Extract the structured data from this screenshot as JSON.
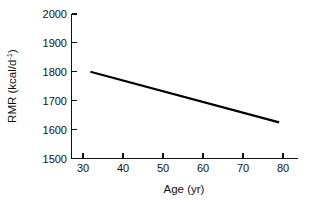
{
  "chart_data": {
    "type": "line",
    "title": "",
    "xlabel": "Age (yr)",
    "ylabel": "RMR (kcal/d",
    "ylabel_sup": "-1",
    "ylabel_close": ")",
    "xlim": [
      25,
      85
    ],
    "ylim": [
      1500,
      2000
    ],
    "grid": false,
    "legend": "none",
    "xticks": [
      30,
      40,
      50,
      60,
      70,
      80
    ],
    "xtick_labels": [
      "30",
      "40",
      "50",
      "60",
      "70",
      "80"
    ],
    "yticks": [
      1500,
      1600,
      1700,
      1800,
      1900,
      2000
    ],
    "ytick_labels": [
      "1500",
      "1600",
      "1700",
      "1800",
      "1900",
      "2000"
    ],
    "series": [
      {
        "name": "RMR vs Age",
        "color": "#000000",
        "x": [
          30,
          80
        ],
        "values": [
          1800,
          1625
        ]
      }
    ]
  },
  "colors": {
    "background": "#ffffff",
    "axis": "#111111",
    "line": "#000000"
  }
}
